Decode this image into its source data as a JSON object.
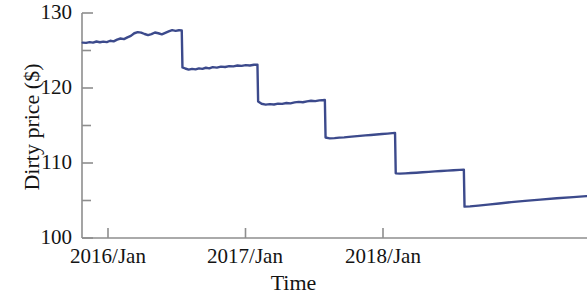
{
  "chart_data": {
    "type": "line",
    "title": "",
    "xlabel": "Time",
    "ylabel": "Dirty price ($)",
    "ylim": [
      100,
      130
    ],
    "y_ticks_major": [
      100,
      110,
      120,
      130
    ],
    "y_tick_labels": [
      "100",
      "110",
      "120",
      "130"
    ],
    "y_ticks_minor": [
      105,
      115,
      125
    ],
    "x_tick_labels": [
      "2016/Jan",
      "2017/Jan",
      "2018/Jan"
    ],
    "x_tick_values": [
      2016.0,
      2017.0,
      2018.0
    ],
    "xlim": [
      2015.81,
      2019.48
    ],
    "grid": false,
    "legend": null,
    "line_color": "#3c4a8c",
    "axis_color": "#8a8a8a",
    "series": [
      {
        "name": "Dirty price",
        "description": "Sawtooth bond dirty price: gradual accrual drift upward punctuated by coupon-payment drops.",
        "points": [
          [
            2015.815,
            126.05
          ],
          [
            2015.84,
            126.02
          ],
          [
            2015.865,
            126.12
          ],
          [
            2015.89,
            126.05
          ],
          [
            2015.915,
            126.2
          ],
          [
            2015.94,
            126.1
          ],
          [
            2015.965,
            126.18
          ],
          [
            2015.99,
            126.12
          ],
          [
            2016.015,
            126.3
          ],
          [
            2016.04,
            126.22
          ],
          [
            2016.065,
            126.45
          ],
          [
            2016.09,
            126.6
          ],
          [
            2016.115,
            126.52
          ],
          [
            2016.14,
            126.75
          ],
          [
            2016.165,
            126.95
          ],
          [
            2016.19,
            127.3
          ],
          [
            2016.215,
            127.45
          ],
          [
            2016.24,
            127.38
          ],
          [
            2016.265,
            127.2
          ],
          [
            2016.29,
            127.05
          ],
          [
            2016.315,
            127.18
          ],
          [
            2016.34,
            127.4
          ],
          [
            2016.365,
            127.3
          ],
          [
            2016.39,
            127.15
          ],
          [
            2016.415,
            127.35
          ],
          [
            2016.44,
            127.55
          ],
          [
            2016.465,
            127.72
          ],
          [
            2016.49,
            127.62
          ],
          [
            2016.515,
            127.7
          ],
          [
            2016.535,
            127.68
          ],
          [
            2016.54,
            122.75
          ],
          [
            2016.56,
            122.6
          ],
          [
            2016.585,
            122.45
          ],
          [
            2016.61,
            122.55
          ],
          [
            2016.635,
            122.48
          ],
          [
            2016.66,
            122.62
          ],
          [
            2016.685,
            122.55
          ],
          [
            2016.71,
            122.7
          ],
          [
            2016.735,
            122.62
          ],
          [
            2016.76,
            122.78
          ],
          [
            2016.79,
            122.72
          ],
          [
            2016.82,
            122.85
          ],
          [
            2016.85,
            122.8
          ],
          [
            2016.88,
            122.92
          ],
          [
            2016.91,
            122.88
          ],
          [
            2016.94,
            123.0
          ],
          [
            2016.97,
            122.95
          ],
          [
            2017.0,
            123.05
          ],
          [
            2017.03,
            123.0
          ],
          [
            2017.06,
            123.1
          ],
          [
            2017.085,
            123.12
          ],
          [
            2017.09,
            118.2
          ],
          [
            2017.115,
            117.9
          ],
          [
            2017.145,
            117.78
          ],
          [
            2017.175,
            117.85
          ],
          [
            2017.205,
            117.8
          ],
          [
            2017.235,
            117.92
          ],
          [
            2017.265,
            117.88
          ],
          [
            2017.295,
            118.0
          ],
          [
            2017.325,
            117.95
          ],
          [
            2017.355,
            118.08
          ],
          [
            2017.385,
            118.15
          ],
          [
            2017.415,
            118.1
          ],
          [
            2017.445,
            118.22
          ],
          [
            2017.475,
            118.3
          ],
          [
            2017.505,
            118.25
          ],
          [
            2017.535,
            118.35
          ],
          [
            2017.575,
            118.4
          ],
          [
            2017.58,
            113.4
          ],
          [
            2017.61,
            113.28
          ],
          [
            2017.645,
            113.32
          ],
          [
            2017.68,
            113.38
          ],
          [
            2017.715,
            113.42
          ],
          [
            2017.75,
            113.48
          ],
          [
            2017.79,
            113.55
          ],
          [
            2017.83,
            113.62
          ],
          [
            2017.87,
            113.68
          ],
          [
            2017.91,
            113.74
          ],
          [
            2017.95,
            113.8
          ],
          [
            2017.99,
            113.86
          ],
          [
            2018.03,
            113.92
          ],
          [
            2018.065,
            113.98
          ],
          [
            2018.085,
            114.02
          ],
          [
            2018.09,
            108.62
          ],
          [
            2018.12,
            108.58
          ],
          [
            2018.16,
            108.62
          ],
          [
            2018.2,
            108.66
          ],
          [
            2018.24,
            108.7
          ],
          [
            2018.285,
            108.76
          ],
          [
            2018.33,
            108.82
          ],
          [
            2018.375,
            108.88
          ],
          [
            2018.42,
            108.93
          ],
          [
            2018.465,
            108.98
          ],
          [
            2018.51,
            109.03
          ],
          [
            2018.555,
            109.08
          ],
          [
            2018.585,
            109.12
          ],
          [
            2018.59,
            104.18
          ],
          [
            2018.63,
            104.22
          ],
          [
            2018.69,
            104.32
          ],
          [
            2018.76,
            104.45
          ],
          [
            2018.84,
            104.6
          ],
          [
            2018.93,
            104.78
          ],
          [
            2019.03,
            104.95
          ],
          [
            2019.14,
            105.12
          ],
          [
            2019.26,
            105.3
          ],
          [
            2019.38,
            105.45
          ],
          [
            2019.475,
            105.58
          ]
        ]
      }
    ]
  },
  "axis_titles": {
    "y": "Dirty price ($)",
    "x": "Time"
  }
}
